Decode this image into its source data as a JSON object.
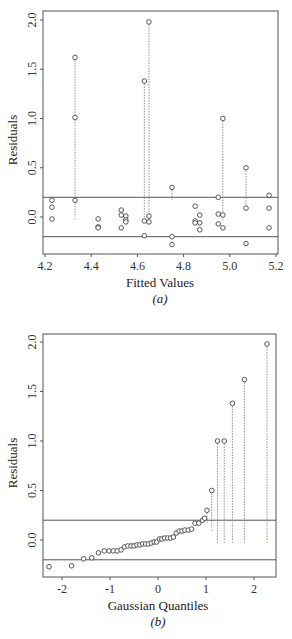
{
  "chart_data": [
    {
      "type": "scatter",
      "panel": "(a)",
      "xlabel": "Fitted Values",
      "ylabel": "Residuals",
      "xlim": [
        4.2,
        5.2
      ],
      "ylim": [
        -0.35,
        2.05
      ],
      "xticks": [
        "4.2",
        "4.4",
        "4.6",
        "4.8",
        "5.0",
        "5.2"
      ],
      "yticks": [
        "0.0",
        "0.5",
        "1.0",
        "1.5",
        "2.0"
      ],
      "reference_lines": [
        0.2,
        -0.2
      ],
      "points": [
        {
          "x": 4.23,
          "y": 0.17
        },
        {
          "x": 4.23,
          "y": 0.1
        },
        {
          "x": 4.23,
          "y": -0.02
        },
        {
          "x": 4.33,
          "y": 1.62,
          "drop_to": 0.0
        },
        {
          "x": 4.33,
          "y": 1.01
        },
        {
          "x": 4.33,
          "y": 0.17
        },
        {
          "x": 4.43,
          "y": -0.02
        },
        {
          "x": 4.43,
          "y": -0.1
        },
        {
          "x": 4.43,
          "y": -0.11
        },
        {
          "x": 4.53,
          "y": 0.07
        },
        {
          "x": 4.53,
          "y": 0.02
        },
        {
          "x": 4.53,
          "y": -0.11
        },
        {
          "x": 4.55,
          "y": 0.01
        },
        {
          "x": 4.55,
          "y": -0.03
        },
        {
          "x": 4.55,
          "y": -0.05
        },
        {
          "x": 4.63,
          "y": 1.38,
          "drop_to": 0.0
        },
        {
          "x": 4.63,
          "y": -0.04
        },
        {
          "x": 4.63,
          "y": -0.19
        },
        {
          "x": 4.65,
          "y": 1.98,
          "drop_to": 0.0
        },
        {
          "x": 4.65,
          "y": 0.01
        },
        {
          "x": 4.65,
          "y": -0.05
        },
        {
          "x": 4.75,
          "y": 0.3,
          "drop_to": 0.2
        },
        {
          "x": 4.75,
          "y": -0.2
        },
        {
          "x": 4.75,
          "y": -0.28
        },
        {
          "x": 4.85,
          "y": 0.11
        },
        {
          "x": 4.85,
          "y": -0.04
        },
        {
          "x": 4.85,
          "y": -0.06
        },
        {
          "x": 4.87,
          "y": 0.02
        },
        {
          "x": 4.87,
          "y": -0.06
        },
        {
          "x": 4.87,
          "y": -0.13
        },
        {
          "x": 4.95,
          "y": 0.2
        },
        {
          "x": 4.95,
          "y": 0.03
        },
        {
          "x": 4.95,
          "y": -0.07
        },
        {
          "x": 4.97,
          "y": 1.0,
          "drop_to": 0.0
        },
        {
          "x": 4.97,
          "y": 0.02
        },
        {
          "x": 4.97,
          "y": -0.11
        },
        {
          "x": 5.07,
          "y": 0.5,
          "drop_to": 0.1
        },
        {
          "x": 5.07,
          "y": 0.09
        },
        {
          "x": 5.07,
          "y": -0.27
        },
        {
          "x": 5.17,
          "y": 0.22
        },
        {
          "x": 5.17,
          "y": 0.09
        },
        {
          "x": 5.17,
          "y": -0.11
        }
      ]
    },
    {
      "type": "scatter",
      "panel": "(b)",
      "xlabel": "Gaussian Quantiles",
      "ylabel": "Residuals",
      "xlim": [
        -2.45,
        2.45
      ],
      "ylim": [
        -0.38,
        2.05
      ],
      "xticks": [
        "-2",
        "-1",
        "0",
        "1",
        "2"
      ],
      "yticks": [
        "0.0",
        "0.5",
        "1.0",
        "1.5",
        "2.0"
      ],
      "reference_lines": [
        0.2,
        -0.2
      ],
      "points": [
        {
          "x": -2.27,
          "y": -0.27
        },
        {
          "x": -1.8,
          "y": -0.26
        },
        {
          "x": -1.55,
          "y": -0.19
        },
        {
          "x": -1.38,
          "y": -0.18
        },
        {
          "x": -1.24,
          "y": -0.13
        },
        {
          "x": -1.12,
          "y": -0.11
        },
        {
          "x": -1.02,
          "y": -0.11
        },
        {
          "x": -0.93,
          "y": -0.11
        },
        {
          "x": -0.85,
          "y": -0.11
        },
        {
          "x": -0.77,
          "y": -0.1
        },
        {
          "x": -0.7,
          "y": -0.07
        },
        {
          "x": -0.63,
          "y": -0.06
        },
        {
          "x": -0.56,
          "y": -0.06
        },
        {
          "x": -0.5,
          "y": -0.06
        },
        {
          "x": -0.44,
          "y": -0.05
        },
        {
          "x": -0.38,
          "y": -0.05
        },
        {
          "x": -0.32,
          "y": -0.04
        },
        {
          "x": -0.26,
          "y": -0.04
        },
        {
          "x": -0.2,
          "y": -0.04
        },
        {
          "x": -0.14,
          "y": -0.03
        },
        {
          "x": -0.08,
          "y": -0.02
        },
        {
          "x": -0.03,
          "y": -0.02
        },
        {
          "x": 0.03,
          "y": 0.01
        },
        {
          "x": 0.08,
          "y": 0.01
        },
        {
          "x": 0.14,
          "y": 0.02
        },
        {
          "x": 0.2,
          "y": 0.02
        },
        {
          "x": 0.26,
          "y": 0.02
        },
        {
          "x": 0.32,
          "y": 0.03
        },
        {
          "x": 0.38,
          "y": 0.07
        },
        {
          "x": 0.44,
          "y": 0.09
        },
        {
          "x": 0.5,
          "y": 0.09
        },
        {
          "x": 0.56,
          "y": 0.1
        },
        {
          "x": 0.63,
          "y": 0.1
        },
        {
          "x": 0.7,
          "y": 0.11
        },
        {
          "x": 0.77,
          "y": 0.17
        },
        {
          "x": 0.85,
          "y": 0.17
        },
        {
          "x": 0.93,
          "y": 0.2
        },
        {
          "x": 0.97,
          "y": 0.22
        },
        {
          "x": 1.02,
          "y": 0.3,
          "drop_to": 0.2
        },
        {
          "x": 1.12,
          "y": 0.5,
          "drop_to": 0.12
        },
        {
          "x": 1.24,
          "y": 1.0,
          "drop_to": 0.0
        },
        {
          "x": 1.38,
          "y": 1.0,
          "drop_to": 0.0
        },
        {
          "x": 1.55,
          "y": 1.38,
          "drop_to": 0.0
        },
        {
          "x": 1.8,
          "y": 1.62,
          "drop_to": 0.0
        },
        {
          "x": 2.27,
          "y": 1.98,
          "drop_to": 0.0
        }
      ]
    }
  ],
  "panels": {
    "a": {
      "xlabel": "Fitted Values",
      "ylabel": "Residuals",
      "caption": "(a)",
      "xticks": [
        "4.2",
        "4.4",
        "4.6",
        "4.8",
        "5.0",
        "5.2"
      ],
      "yticks": [
        "0.0",
        "0.5",
        "1.0",
        "1.5",
        "2.0"
      ]
    },
    "b": {
      "xlabel": "Gaussian Quantiles",
      "ylabel": "Residuals",
      "caption": "(b)",
      "xticks": [
        "-2",
        "-1",
        "0",
        "1",
        "2"
      ],
      "yticks": [
        "0.0",
        "0.5",
        "1.0",
        "1.5",
        "2.0"
      ]
    }
  }
}
